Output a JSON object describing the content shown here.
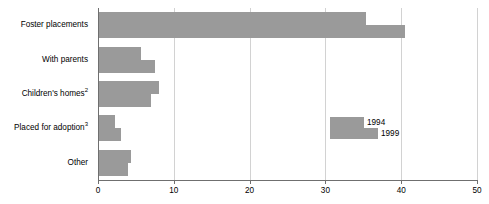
{
  "chart_data": {
    "type": "bar",
    "orientation": "horizontal",
    "title": "",
    "xlabel": "",
    "ylabel": "",
    "xlim": [
      0,
      50
    ],
    "xticks": [
      0,
      10,
      20,
      30,
      40,
      50
    ],
    "xtick_labels": [
      "0",
      "10",
      "20",
      "30",
      "40",
      "50"
    ],
    "grid": true,
    "legend_position": "inside-right",
    "categories": [
      "Foster placements",
      "With parents",
      "Children's homes",
      "Placed for adoption",
      "Other"
    ],
    "category_footnotes": [
      "",
      "",
      "2",
      "3",
      ""
    ],
    "series": [
      {
        "name": "1994",
        "color": "#9a9a9a",
        "values": [
          35.4,
          5.7,
          8.1,
          2.2,
          4.3
        ]
      },
      {
        "name": "1999",
        "color": "#9a9a9a",
        "values": [
          40.5,
          7.5,
          7.0,
          3.0,
          4.0
        ]
      }
    ]
  },
  "legend": {
    "entries": [
      {
        "label": "1994"
      },
      {
        "label": "1999"
      }
    ]
  },
  "axis": {
    "line_color": "#6f6f6f",
    "grid_color": "#d2d2d2"
  }
}
